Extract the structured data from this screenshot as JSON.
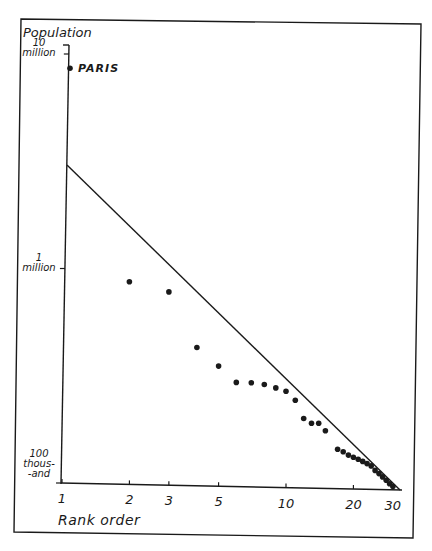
{
  "chart_data": {
    "type": "scatter",
    "title": "",
    "xlabel": "Rank order",
    "ylabel": "Population",
    "x_scale": "log",
    "y_scale": "log",
    "xlim": [
      1,
      32
    ],
    "ylim": [
      100000,
      10000000
    ],
    "grid": false,
    "legend": null,
    "x_ticks": [
      {
        "value": 1,
        "label": "1"
      },
      {
        "value": 2,
        "label": "2"
      },
      {
        "value": 3,
        "label": "3"
      },
      {
        "value": 5,
        "label": "5"
      },
      {
        "value": 10,
        "label": "10"
      },
      {
        "value": 20,
        "label": "20"
      },
      {
        "value": 30,
        "label": "30"
      }
    ],
    "y_ticks": [
      {
        "value": 10000000,
        "label_lines": [
          "10",
          "million"
        ]
      },
      {
        "value": 1000000,
        "label_lines": [
          "1",
          "million"
        ]
      },
      {
        "value": 100000,
        "label_lines": [
          "100",
          "thous-",
          "-and"
        ]
      }
    ],
    "annotations": [
      {
        "text": "PARIS",
        "rank": 1,
        "population": 8600000
      }
    ],
    "reference_line": {
      "description": "Rank-size rule line",
      "from": {
        "rank": 1,
        "population": 3300000
      },
      "to": {
        "rank": 31,
        "population": 100000
      }
    },
    "series": [
      {
        "name": "Cities",
        "points": [
          {
            "rank": 1,
            "population": 8600000
          },
          {
            "rank": 2,
            "population": 880000
          },
          {
            "rank": 3,
            "population": 795000
          },
          {
            "rank": 4,
            "population": 440000
          },
          {
            "rank": 5,
            "population": 362000
          },
          {
            "rank": 6,
            "population": 305000
          },
          {
            "rank": 7,
            "population": 305000
          },
          {
            "rank": 8,
            "population": 300000
          },
          {
            "rank": 9,
            "population": 290000
          },
          {
            "rank": 10,
            "population": 280000
          },
          {
            "rank": 11,
            "population": 255000
          },
          {
            "rank": 12,
            "population": 210000
          },
          {
            "rank": 13,
            "population": 200000
          },
          {
            "rank": 14,
            "population": 200000
          },
          {
            "rank": 15,
            "population": 185000
          },
          {
            "rank": 17,
            "population": 152000
          },
          {
            "rank": 18,
            "population": 148000
          },
          {
            "rank": 19,
            "population": 143000
          },
          {
            "rank": 20,
            "population": 140000
          },
          {
            "rank": 21,
            "population": 137000
          },
          {
            "rank": 22,
            "population": 134000
          },
          {
            "rank": 23,
            "population": 131000
          },
          {
            "rank": 24,
            "population": 128000
          },
          {
            "rank": 25,
            "population": 122000
          },
          {
            "rank": 26,
            "population": 118000
          },
          {
            "rank": 27,
            "population": 114000
          },
          {
            "rank": 28,
            "population": 110000
          },
          {
            "rank": 29,
            "population": 106000
          },
          {
            "rank": 30,
            "population": 103000
          }
        ]
      }
    ]
  }
}
